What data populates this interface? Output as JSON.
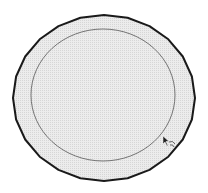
{
  "viewport": {
    "background": "#ffffff",
    "tool": "offset-tool"
  },
  "model": {
    "outer_circle": {
      "cx": 104,
      "cy": 98,
      "rx": 91,
      "ry": 83,
      "segments": 24,
      "stroke": "#1a1a1a",
      "fill": "#e4e4e4"
    },
    "inner_circle": {
      "cx": 103,
      "cy": 95,
      "rx": 72,
      "ry": 66,
      "stroke": "#555555"
    }
  },
  "cursor": {
    "icon": "offset-cursor-icon",
    "x": 163,
    "y": 136
  }
}
